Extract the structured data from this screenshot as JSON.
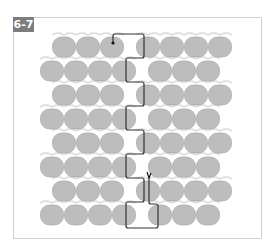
{
  "figure": {
    "label": "6-7",
    "colors": {
      "bead_fill": "#bdbdbd",
      "bead_stroke": "#a0a0a0",
      "connector": "#d8d8d8",
      "thread": "#333333",
      "label_bg": "#7d7d7d",
      "frame": "#cfcfcf"
    },
    "rows": [
      {
        "y": 47,
        "beads": [
          64,
          88,
          112,
          148,
          172,
          196,
          220
        ]
      },
      {
        "y": 71,
        "beads": [
          52,
          76,
          100,
          124,
          160,
          184,
          208
        ]
      },
      {
        "y": 95,
        "beads": [
          64,
          88,
          112,
          148,
          172,
          196,
          220
        ]
      },
      {
        "y": 119,
        "beads": [
          52,
          76,
          100,
          124,
          160,
          184,
          208
        ]
      },
      {
        "y": 143,
        "beads": [
          64,
          88,
          112,
          148,
          172,
          196,
          220
        ]
      },
      {
        "y": 167,
        "beads": [
          52,
          76,
          100,
          124,
          160,
          184,
          208
        ]
      },
      {
        "y": 191,
        "beads": [
          64,
          88,
          112,
          148,
          172,
          196,
          220
        ]
      },
      {
        "y": 215,
        "beads": [
          52,
          76,
          100,
          124,
          160,
          184,
          208
        ]
      }
    ]
  }
}
